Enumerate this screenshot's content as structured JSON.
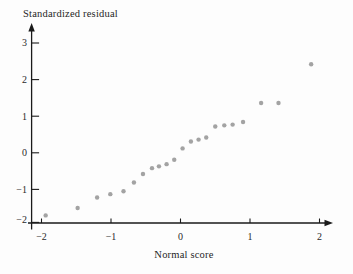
{
  "figure": {
    "background_color": "#fdfdfd",
    "axis_color": "#1a1a1a",
    "tick_text_color": "#2a2a2a"
  },
  "chart_data": {
    "type": "scatter",
    "title": "",
    "xlabel": "Normal score",
    "ylabel": "Standardized residual",
    "xlim": [
      -2.2,
      2.2
    ],
    "ylim": [
      -2,
      3.5
    ],
    "x_ticks": [
      -2,
      -1,
      0,
      1,
      2
    ],
    "y_ticks": [
      3,
      2,
      1,
      0,
      -1,
      -2
    ],
    "grid": false,
    "legend": null,
    "point_color": "#9b9b9b",
    "points": [
      {
        "x": -1.94,
        "y": -1.71
      },
      {
        "x": -1.48,
        "y": -1.51
      },
      {
        "x": -1.2,
        "y": -1.22
      },
      {
        "x": -1.01,
        "y": -1.13
      },
      {
        "x": -0.82,
        "y": -1.05
      },
      {
        "x": -0.67,
        "y": -0.81
      },
      {
        "x": -0.54,
        "y": -0.58
      },
      {
        "x": -0.41,
        "y": -0.42
      },
      {
        "x": -0.31,
        "y": -0.37
      },
      {
        "x": -0.2,
        "y": -0.31
      },
      {
        "x": -0.09,
        "y": -0.19
      },
      {
        "x": 0.03,
        "y": 0.12
      },
      {
        "x": 0.15,
        "y": 0.31
      },
      {
        "x": 0.26,
        "y": 0.36
      },
      {
        "x": 0.37,
        "y": 0.42
      },
      {
        "x": 0.5,
        "y": 0.72
      },
      {
        "x": 0.63,
        "y": 0.75
      },
      {
        "x": 0.75,
        "y": 0.77
      },
      {
        "x": 0.9,
        "y": 0.84
      },
      {
        "x": 1.16,
        "y": 1.36
      },
      {
        "x": 1.41,
        "y": 1.36
      },
      {
        "x": 1.88,
        "y": 2.42
      }
    ]
  }
}
